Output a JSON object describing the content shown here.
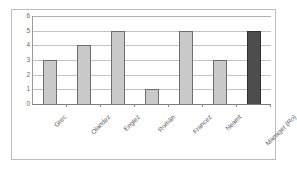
{
  "chart_data": {
    "type": "bar",
    "title": "",
    "xlabel": "",
    "ylabel": "",
    "categories": [
      "Grec",
      "Olandez",
      "Englez",
      "Român",
      "Francez",
      "Neamt",
      "Manager (Ro)"
    ],
    "values": [
      3,
      4,
      5,
      1,
      5,
      3,
      5
    ],
    "ylim": [
      0,
      6
    ],
    "yticks": [
      6,
      5,
      4,
      3,
      2,
      1,
      0
    ],
    "grid": true,
    "legend": "none",
    "series": [
      {
        "name": "",
        "values": [
          3,
          4,
          5,
          1,
          5,
          3,
          5
        ]
      }
    ],
    "bar_colors": [
      "#c9c9c9",
      "#c9c9c9",
      "#c9c9c9",
      "#c9c9c9",
      "#c9c9c9",
      "#c9c9c9",
      "#4d4d4d"
    ],
    "highlight_index": 6,
    "colors": {
      "bar_light": "#c9c9c9",
      "bar_dark": "#4d4d4d",
      "gridline": "#c2c2c2",
      "axis": "#7d7d7d",
      "frame": "#bdbdbd",
      "text": "#575757",
      "background": "#ffffff"
    }
  }
}
